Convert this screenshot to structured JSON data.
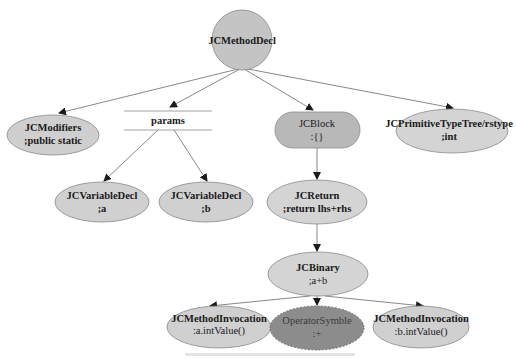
{
  "diagram": {
    "type": "ast-tree",
    "colors": {
      "node_fill": "#cfcfcf",
      "node_stroke": "#8a8a8a",
      "block_fill": "#b8b8b8",
      "operator_fill": "#8c8c8c",
      "edge": "#6a6a6a",
      "text": "#1a1a1a"
    },
    "nodes": {
      "root": {
        "title": "JCMethodDecl",
        "shape": "circle"
      },
      "modifiers": {
        "title": "JCModifiers",
        "value": ";public static",
        "shape": "ellipse"
      },
      "params": {
        "title": "params",
        "shape": "record-lines"
      },
      "block": {
        "title": "JCBlock",
        "value": ":{}",
        "shape": "rounded-rect"
      },
      "rettype": {
        "title": "JCPrimitiveTypeTree/rstype",
        "value": ";int",
        "shape": "ellipse"
      },
      "var_a": {
        "title": "JCVariableDecl",
        "value": ";a",
        "shape": "ellipse"
      },
      "var_b": {
        "title": "JCVariableDecl",
        "value": ";b",
        "shape": "ellipse"
      },
      "ret": {
        "title": "JCReturn",
        "value": ";return lhs+rhs",
        "shape": "ellipse"
      },
      "binary": {
        "title": "JCBinary",
        "value": ";a+b",
        "shape": "ellipse"
      },
      "invoke_a": {
        "title": "JCMethodInvocation",
        "value": ":a.intValue()",
        "shape": "ellipse"
      },
      "operator": {
        "title": "OperatorSymble",
        "value": ":+",
        "shape": "dashed-ellipse"
      },
      "invoke_b": {
        "title": "JCMethodInvocation",
        "value": ":b.intValue()",
        "shape": "ellipse"
      }
    },
    "edges": [
      [
        "root",
        "modifiers"
      ],
      [
        "root",
        "params"
      ],
      [
        "root",
        "block"
      ],
      [
        "root",
        "rettype"
      ],
      [
        "params",
        "var_a"
      ],
      [
        "params",
        "var_b"
      ],
      [
        "block",
        "ret"
      ],
      [
        "ret",
        "binary"
      ],
      [
        "binary",
        "invoke_a"
      ],
      [
        "binary",
        "operator"
      ],
      [
        "binary",
        "invoke_b"
      ]
    ]
  }
}
